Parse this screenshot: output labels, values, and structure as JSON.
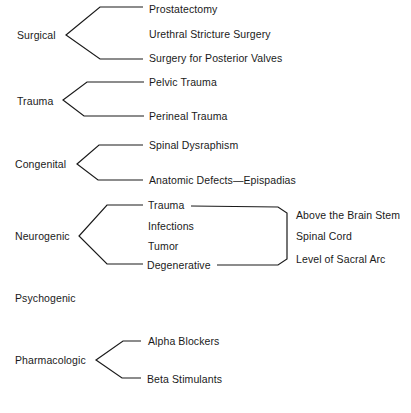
{
  "diagram": {
    "categories": [
      {
        "id": "surgical",
        "label": "Surgical",
        "items": [
          "Prostatectomy",
          "Urethral Stricture Surgery",
          "Surgery for Posterior Valves"
        ]
      },
      {
        "id": "trauma",
        "label": "Trauma",
        "items": [
          "Pelvic Trauma",
          "Perineal Trauma"
        ]
      },
      {
        "id": "congenital",
        "label": "Congenital",
        "items": [
          "Spinal Dysraphism",
          "Anatomic Defects—Epispadias"
        ]
      },
      {
        "id": "neurogenic",
        "label": "Neurogenic",
        "items": [
          "Trauma",
          "Infections",
          "Tumor",
          "Degenerative"
        ],
        "levels": [
          "Above the Brain Stem",
          "Spinal Cord",
          "Level of Sacral Arc"
        ]
      },
      {
        "id": "psychogenic",
        "label": "Psychogenic",
        "items": []
      },
      {
        "id": "pharmacologic",
        "label": "Pharmacologic",
        "items": [
          "Alpha Blockers",
          "Beta Stimulants"
        ]
      }
    ]
  }
}
